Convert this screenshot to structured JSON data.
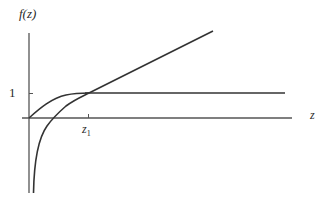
{
  "diagram": {
    "y_axis_label": "f(z)",
    "x_axis_label": "z",
    "y_tick_label": "1",
    "x_tick_label_base": "z",
    "x_tick_label_sub": "1",
    "colors": {
      "curve": "#333333",
      "axis": "#555555",
      "background": "#ffffff"
    },
    "elements": [
      {
        "name": "saturating-curve",
        "description": "Curve rising from origin and leveling off at f(z)=1"
      },
      {
        "name": "horizontal-line-one",
        "description": "Horizontal line at f(z)=1"
      },
      {
        "name": "log-curve",
        "description": "Curve diverging to -infinity near z=0, crossing the axis and rising through (z1, 1)"
      },
      {
        "name": "z1-tick",
        "description": "Tick on z-axis marking intersection point z1"
      }
    ]
  }
}
